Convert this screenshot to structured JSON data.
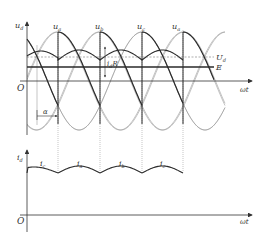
{
  "diagram": {
    "type": "three-phase half-wave controlled rectifier waveforms (back-EMF load)",
    "colors": {
      "axis": "#333333",
      "bold_curve": "#2a2a2a",
      "thin_curve": "#9a9a9a",
      "guide": "#8a8a8a",
      "background": "#ffffff"
    },
    "top_plot": {
      "y_axis_label": "u",
      "y_axis_sub": "d",
      "x_axis_label": "ωt",
      "origin_label": "O",
      "phase_labels": [
        {
          "main": "u",
          "sub": "a"
        },
        {
          "main": "u",
          "sub": "b"
        },
        {
          "main": "u",
          "sub": "c"
        },
        {
          "main": "u",
          "sub": "a"
        }
      ],
      "ud_level_label": {
        "main": "U",
        "sub": "d"
      },
      "e_level_label": "E",
      "ripple_label": {
        "main": "i",
        "sub": "d",
        "suffix": "R"
      },
      "firing_angle_label": "α"
    },
    "bottom_plot": {
      "y_axis_label": "i",
      "y_axis_sub": "d",
      "x_axis_label": "ωt",
      "origin_label": "O",
      "segment_labels": [
        {
          "main": "i",
          "sub": "c"
        },
        {
          "main": "i",
          "sub": "a"
        },
        {
          "main": "i",
          "sub": "b"
        },
        {
          "main": "i",
          "sub": "c"
        }
      ]
    }
  }
}
